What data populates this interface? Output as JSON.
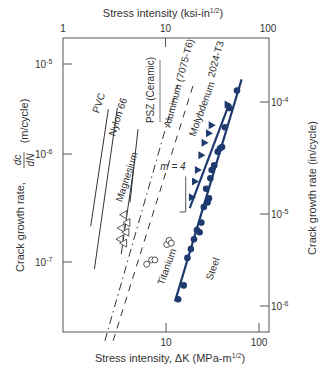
{
  "chart_data": {
    "type": "scatter",
    "title": "",
    "xlabel_bottom": "Stress intensity, ΔK (MPa-m",
    "xlabel_bottom_sup": "1/2",
    "xlabel_bottom_end": ")",
    "xlabel_top": "Stress intensity (ksi-in",
    "xlabel_top_sup": "1/2",
    "xlabel_top_end": ")",
    "ylabel_left_prefix": "Crack growth rate,",
    "ylabel_left_num": "dc",
    "ylabel_left_den": "dN",
    "ylabel_left_unit": "(m/cycle)",
    "ylabel_right": "Crack growth rate (in/cycle)",
    "x_bottom_ticks": [
      {
        "value": 10,
        "label": "10"
      },
      {
        "value": 100,
        "label": "100"
      }
    ],
    "x_top_ticks": [
      {
        "value": 1,
        "label": "1"
      },
      {
        "value": 10,
        "label": "10"
      },
      {
        "value": 100,
        "label": "100"
      }
    ],
    "y_left_ticks": [
      {
        "exp": -5,
        "label": "10",
        "sup": "-5"
      },
      {
        "exp": -6,
        "label": "10",
        "sup": "-6"
      },
      {
        "exp": -7,
        "label": "10",
        "sup": "-7"
      }
    ],
    "y_right_ticks": [
      {
        "exp": -4,
        "label": "10",
        "sup": "-4"
      },
      {
        "exp": -5,
        "label": "10",
        "sup": "-5"
      },
      {
        "exp": -6,
        "label": "10",
        "sup": "-6"
      }
    ],
    "xlim_mpa": [
      1.1,
      110
    ],
    "ylim_m_per_cycle": [
      1.5e-08,
      1.3e-05
    ],
    "lines": [
      {
        "name": "PVC",
        "style": "solid",
        "from": [
          1.55,
          2.3e-07
        ],
        "to": [
          2.4,
          3.5e-06
        ]
      },
      {
        "name": "Nylon 66",
        "style": "solid",
        "from": [
          1.7,
          8.5e-08
        ],
        "to": [
          3.0,
          3.6e-06
        ]
      },
      {
        "name": "Magnesium",
        "style": "solid",
        "from": [
          3.3,
          1.2e-07
        ],
        "to": [
          4.5,
          9e-07
        ]
      },
      {
        "name": "PSZ (Ceramic)",
        "style": "solid",
        "from": [
          4.1,
          4e-07
        ],
        "to": [
          5.0,
          2.2e-06
        ]
      },
      {
        "name": "Aluminum (7075-T6)",
        "style": "dashdot",
        "from": [
          2.2,
          1.6e-08
        ],
        "to": [
          13.5,
          6.2e-06
        ]
      },
      {
        "name": "2024-T3",
        "style": "dashed",
        "from": [
          2.7,
          1.6e-08
        ],
        "to": [
          20,
          6.5e-06
        ]
      },
      {
        "name": "Molybdenum",
        "style": "solid",
        "from": [
          18,
          3.5e-07
        ],
        "to": [
          48,
          4e-06
        ]
      },
      {
        "name": "Steel",
        "style": "solid",
        "from": [
          12.5,
          4e-08
        ],
        "to": [
          65,
          7e-06
        ]
      }
    ],
    "series": [
      {
        "name": "Magnesium",
        "marker": "open-triangle",
        "points": [
          [
            3.5,
            3e-07
          ],
          [
            3.8,
            2.5e-07
          ],
          [
            3.3,
            2.2e-07
          ],
          [
            3.7,
            2e-07
          ],
          [
            3.2,
            1.7e-07
          ],
          [
            3.5,
            1.55e-07
          ]
        ]
      },
      {
        "name": "Titanium",
        "marker": "open-circle",
        "points": [
          [
            6.2,
            9.5e-08
          ],
          [
            7.0,
            1.05e-07
          ],
          [
            7.6,
            1.05e-07
          ],
          [
            10.2,
            1.5e-07
          ],
          [
            10.8,
            1.65e-07
          ],
          [
            11.4,
            1.55e-07
          ]
        ]
      },
      {
        "name": "Molybdenum",
        "marker": "filled-triangle",
        "points": [
          [
            19,
            4.5e-07
          ],
          [
            20.5,
            6.5e-07
          ],
          [
            22,
            8.5e-07
          ],
          [
            24,
            1.2e-06
          ],
          [
            26,
            1.6e-06
          ],
          [
            29,
            2e-06
          ],
          [
            31,
            2.4e-06
          ],
          [
            46,
            3.9e-06
          ]
        ]
      },
      {
        "name": "Steel",
        "marker": "filled-circle",
        "points": [
          [
            13.5,
            4.2e-08
          ],
          [
            15.5,
            5.8e-08
          ],
          [
            17,
            1.1e-07
          ],
          [
            18.5,
            1.35e-07
          ],
          [
            20,
            1.7e-07
          ],
          [
            21.5,
            2.1e-07
          ],
          [
            23,
            2e-07
          ],
          [
            24,
            2.5e-07
          ],
          [
            25.5,
            3.6e-07
          ],
          [
            28,
            4e-07
          ],
          [
            29,
            4.4e-07
          ],
          [
            27,
            5.5e-07
          ],
          [
            30,
            7e-07
          ],
          [
            31,
            8.5e-07
          ],
          [
            33,
            9.5e-07
          ],
          [
            36,
            1.3e-06
          ],
          [
            38,
            1.4e-06
          ],
          [
            40,
            1.45e-06
          ],
          [
            43,
            2.3e-06
          ],
          [
            48,
            3.6e-06
          ],
          [
            58,
            5.4e-06
          ]
        ]
      }
    ],
    "labels": [
      {
        "text": "PVC"
      },
      {
        "text": "Nylon 66"
      },
      {
        "text": "Magnesium"
      },
      {
        "text": "PSZ (Ceramic)"
      },
      {
        "text": "Aluminum (7075-T6)"
      },
      {
        "text": "2024-T3"
      },
      {
        "text": "Molybdenum"
      },
      {
        "text": "Titanium"
      },
      {
        "text": "Steel"
      },
      {
        "text": "m = 4"
      }
    ],
    "colors": {
      "frame": "#555555",
      "black_lines": "#333333",
      "marker_blue": "#1f3a6e",
      "open_marker": "#444444"
    },
    "grid": false,
    "legend": "none"
  }
}
